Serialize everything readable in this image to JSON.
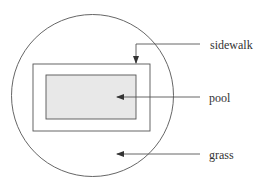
{
  "diagram": {
    "type": "labeled-layout",
    "colors": {
      "line": "#555555",
      "pool_fill": "#e8e8e8",
      "background": "#ffffff",
      "text": "#333333"
    },
    "shapes": {
      "grass_circle": {
        "cx": 92.5,
        "cy": 95.5,
        "r": 81
      },
      "sidewalk_rect": {
        "x": 33,
        "y": 64,
        "width": 117,
        "height": 67
      },
      "pool_rect": {
        "x": 46,
        "y": 75,
        "width": 90,
        "height": 44
      }
    },
    "labels": [
      {
        "id": "sidewalk",
        "text": "sidewalk",
        "x": 210,
        "y": 49
      },
      {
        "id": "pool",
        "text": "pool",
        "x": 209,
        "y": 102
      },
      {
        "id": "grass",
        "text": "grass",
        "x": 209,
        "y": 159
      }
    ]
  }
}
